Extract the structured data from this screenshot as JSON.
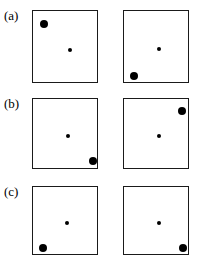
{
  "figure": {
    "background_color": "#ffffff",
    "stroke_color": "#1a1a1a",
    "marker_color": "#000000",
    "panel_width": 66,
    "panel_height": 73,
    "rows": [
      {
        "label": "(a)",
        "label_x": 4,
        "label_y": 9,
        "panels": [
          {
            "name": "panel-a-left",
            "x": 32,
            "y": 10,
            "width": 66,
            "height": 73,
            "markers": [
              {
                "name": "large-marker",
                "size": "large",
                "cx": 11,
                "cy": 13,
                "label": "large dot upper-left"
              },
              {
                "name": "small-marker",
                "size": "small",
                "cx": 37,
                "cy": 39,
                "label": "small dot center"
              }
            ]
          },
          {
            "name": "panel-a-right",
            "x": 123,
            "y": 10,
            "width": 66,
            "height": 73,
            "markers": [
              {
                "name": "small-marker",
                "size": "small",
                "cx": 35,
                "cy": 38,
                "label": "small dot center"
              },
              {
                "name": "large-marker",
                "size": "large",
                "cx": 10,
                "cy": 65,
                "label": "large dot lower-left"
              }
            ]
          }
        ]
      },
      {
        "label": "(b)",
        "label_x": 4,
        "label_y": 97,
        "panels": [
          {
            "name": "panel-b-left",
            "x": 32,
            "y": 98,
            "width": 66,
            "height": 71,
            "markers": [
              {
                "name": "small-marker",
                "size": "small",
                "cx": 35,
                "cy": 37,
                "label": "small dot center"
              },
              {
                "name": "large-marker",
                "size": "large",
                "cx": 60,
                "cy": 62,
                "label": "large dot lower-right"
              }
            ]
          },
          {
            "name": "panel-b-right",
            "x": 123,
            "y": 98,
            "width": 66,
            "height": 71,
            "markers": [
              {
                "name": "large-marker",
                "size": "large",
                "cx": 58,
                "cy": 12,
                "label": "large dot upper-right"
              },
              {
                "name": "small-marker",
                "size": "small",
                "cx": 35,
                "cy": 37,
                "label": "small dot center"
              }
            ]
          }
        ]
      },
      {
        "label": "(c)",
        "label_x": 4,
        "label_y": 185,
        "panels": [
          {
            "name": "panel-c-left",
            "x": 32,
            "y": 186,
            "width": 66,
            "height": 69,
            "markers": [
              {
                "name": "small-marker",
                "size": "small",
                "cx": 34,
                "cy": 36,
                "label": "small dot center"
              },
              {
                "name": "large-marker",
                "size": "large",
                "cx": 10,
                "cy": 61,
                "label": "large dot lower-left"
              }
            ]
          },
          {
            "name": "panel-c-right",
            "x": 123,
            "y": 186,
            "width": 66,
            "height": 69,
            "markers": [
              {
                "name": "small-marker",
                "size": "small",
                "cx": 35,
                "cy": 36,
                "label": "small dot center"
              },
              {
                "name": "large-marker",
                "size": "large",
                "cx": 59,
                "cy": 61,
                "label": "large dot lower-right"
              }
            ]
          }
        ]
      }
    ]
  }
}
